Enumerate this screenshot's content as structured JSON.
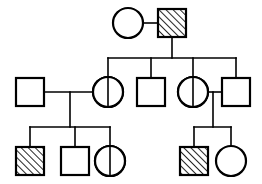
{
  "diagram": {
    "type": "pedigree",
    "width": 262,
    "height": 184,
    "background_color": "#ffffff",
    "line_color": "#000000",
    "fill_color": "#ffffff",
    "hatch_color": "#000000",
    "hatch_angle_degrees": 45,
    "generations": 3,
    "legend": {
      "square": "male",
      "circle": "female",
      "full-hatch": "affected",
      "half-hatch": "carrier",
      "open": "unaffected"
    },
    "individuals": [
      {
        "id": "I-1",
        "generation": 1,
        "shape": "circle",
        "sex": "female",
        "status": "unaffected",
        "fill": "open",
        "cx": 128,
        "cy": 23,
        "r": 15
      },
      {
        "id": "I-2",
        "generation": 1,
        "shape": "square",
        "sex": "male",
        "status": "affected",
        "fill": "full-hatch",
        "x": 158,
        "y": 9,
        "size": 28
      },
      {
        "id": "II-1",
        "generation": 2,
        "shape": "square",
        "sex": "male",
        "status": "unaffected",
        "fill": "open",
        "x": 16,
        "y": 78,
        "size": 28
      },
      {
        "id": "II-2",
        "generation": 2,
        "shape": "circle",
        "sex": "female",
        "status": "carrier",
        "fill": "half-hatch",
        "cx": 108,
        "cy": 92,
        "r": 15
      },
      {
        "id": "II-3",
        "generation": 2,
        "shape": "square",
        "sex": "male",
        "status": "unaffected",
        "fill": "open",
        "x": 137,
        "y": 78,
        "size": 28
      },
      {
        "id": "II-4",
        "generation": 2,
        "shape": "circle",
        "sex": "female",
        "status": "carrier",
        "fill": "half-hatch",
        "cx": 193,
        "cy": 92,
        "r": 15
      },
      {
        "id": "II-5",
        "generation": 2,
        "shape": "square",
        "sex": "male",
        "status": "unaffected",
        "fill": "open",
        "x": 222,
        "y": 78,
        "size": 28
      },
      {
        "id": "III-1",
        "generation": 3,
        "shape": "square",
        "sex": "male",
        "status": "affected",
        "fill": "full-hatch",
        "x": 16,
        "y": 147,
        "size": 28
      },
      {
        "id": "III-2",
        "generation": 3,
        "shape": "square",
        "sex": "male",
        "status": "unaffected",
        "fill": "open",
        "x": 61,
        "y": 147,
        "size": 28
      },
      {
        "id": "III-3",
        "generation": 3,
        "shape": "circle",
        "sex": "female",
        "status": "carrier",
        "fill": "half-hatch",
        "cx": 110,
        "cy": 161,
        "r": 15
      },
      {
        "id": "III-4",
        "generation": 3,
        "shape": "square",
        "sex": "male",
        "status": "affected",
        "fill": "full-hatch",
        "x": 180,
        "y": 147,
        "size": 28
      },
      {
        "id": "III-5",
        "generation": 3,
        "shape": "circle",
        "sex": "female",
        "status": "unaffected",
        "fill": "open",
        "cx": 231,
        "cy": 161,
        "r": 15
      }
    ],
    "matings": [
      {
        "id": "mating-1",
        "partners": [
          "I-1",
          "I-2"
        ],
        "line_y": 23,
        "line_x1": 143,
        "line_x2": 158,
        "descent_x": 172,
        "descent_y1": 23,
        "descent_y2": 58
      },
      {
        "id": "mating-2",
        "partners": [
          "II-1",
          "II-2"
        ],
        "line_y": 92,
        "line_x1": 44,
        "line_x2": 93,
        "descent_x": 70,
        "descent_y1": 92,
        "descent_y2": 127
      },
      {
        "id": "mating-3",
        "partners": [
          "II-4",
          "II-5"
        ],
        "line_y": 92,
        "line_x1": 208,
        "line_x2": 222,
        "descent_x": 213,
        "descent_y1": 92,
        "descent_y2": 127
      }
    ],
    "sibships": [
      {
        "id": "sibship-1",
        "parents": "mating-1",
        "bar_y": 58,
        "bar_x1": 108,
        "bar_x2": 236,
        "children": [
          "II-2",
          "II-3",
          "II-4"
        ],
        "drops": [
          {
            "x": 108,
            "y1": 58,
            "y2": 77
          },
          {
            "x": 151,
            "y1": 58,
            "y2": 78
          },
          {
            "x": 193,
            "y1": 58,
            "y2": 77
          }
        ]
      },
      {
        "id": "sibship-2",
        "parents": "mating-2",
        "bar_y": 127,
        "bar_x1": 30,
        "bar_x2": 110,
        "children": [
          "III-1",
          "III-2",
          "III-3"
        ],
        "drops": [
          {
            "x": 30,
            "y1": 127,
            "y2": 147
          },
          {
            "x": 75,
            "y1": 127,
            "y2": 147
          },
          {
            "x": 110,
            "y1": 127,
            "y2": 146
          }
        ]
      },
      {
        "id": "sibship-3",
        "parents": "mating-3",
        "bar_y": 127,
        "bar_x1": 194,
        "bar_x2": 231,
        "children": [
          "III-4",
          "III-5"
        ],
        "drops": [
          {
            "x": 194,
            "y1": 127,
            "y2": 147
          },
          {
            "x": 231,
            "y1": 127,
            "y2": 146
          }
        ]
      }
    ]
  }
}
